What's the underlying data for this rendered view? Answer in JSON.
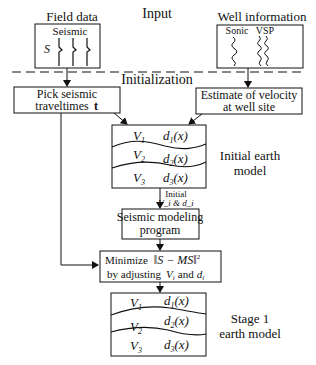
{
  "sections": {
    "input": "Input",
    "initialization": "Initialization"
  },
  "field_data": {
    "title": "Field data",
    "sub": "Seismic",
    "symbol": "S"
  },
  "well_info": {
    "title": "Well information",
    "sonic": "Sonic",
    "vsp": "VSP"
  },
  "pick": {
    "line1": "Pick seismic",
    "line2": "traveltimes",
    "bold": "t"
  },
  "estimate": {
    "line1": "Estimate of velocity",
    "line2": "at well site"
  },
  "initial_model": {
    "label1": "Initial earth",
    "label2": "model",
    "layers": [
      {
        "v": "V",
        "vsub": "1",
        "d": "d",
        "dsub": "1",
        "arg": "(x)"
      },
      {
        "v": "V",
        "vsub": "2",
        "d": "d",
        "dsub": "2",
        "arg": "(x)"
      },
      {
        "v": "V",
        "vsub": "3",
        "d": "d",
        "dsub": "3",
        "arg": "(x)"
      }
    ]
  },
  "initial_params": {
    "line1": "Initial",
    "line2": "V_i & d_i"
  },
  "modeling": {
    "line1": "Seismic modeling",
    "line2": "program"
  },
  "minimize": {
    "line1a": "Minimize",
    "line1b": "‖S − MS‖",
    "sup": "2",
    "line2a": "by adjusting",
    "line2b": "V",
    "line2c": "and",
    "line2d": "d"
  },
  "stage1_model": {
    "label1": "Stage 1",
    "label2": "earth model",
    "layers": [
      {
        "v": "V",
        "vsub": "1",
        "d": "d",
        "dsub": "1",
        "arg": "(x)"
      },
      {
        "v": "V",
        "vsub": "2",
        "d": "d",
        "dsub": "2",
        "arg": "(x)"
      },
      {
        "v": "V",
        "vsub": "3",
        "d": "d",
        "dsub": "3",
        "arg": "(x)"
      }
    ]
  }
}
